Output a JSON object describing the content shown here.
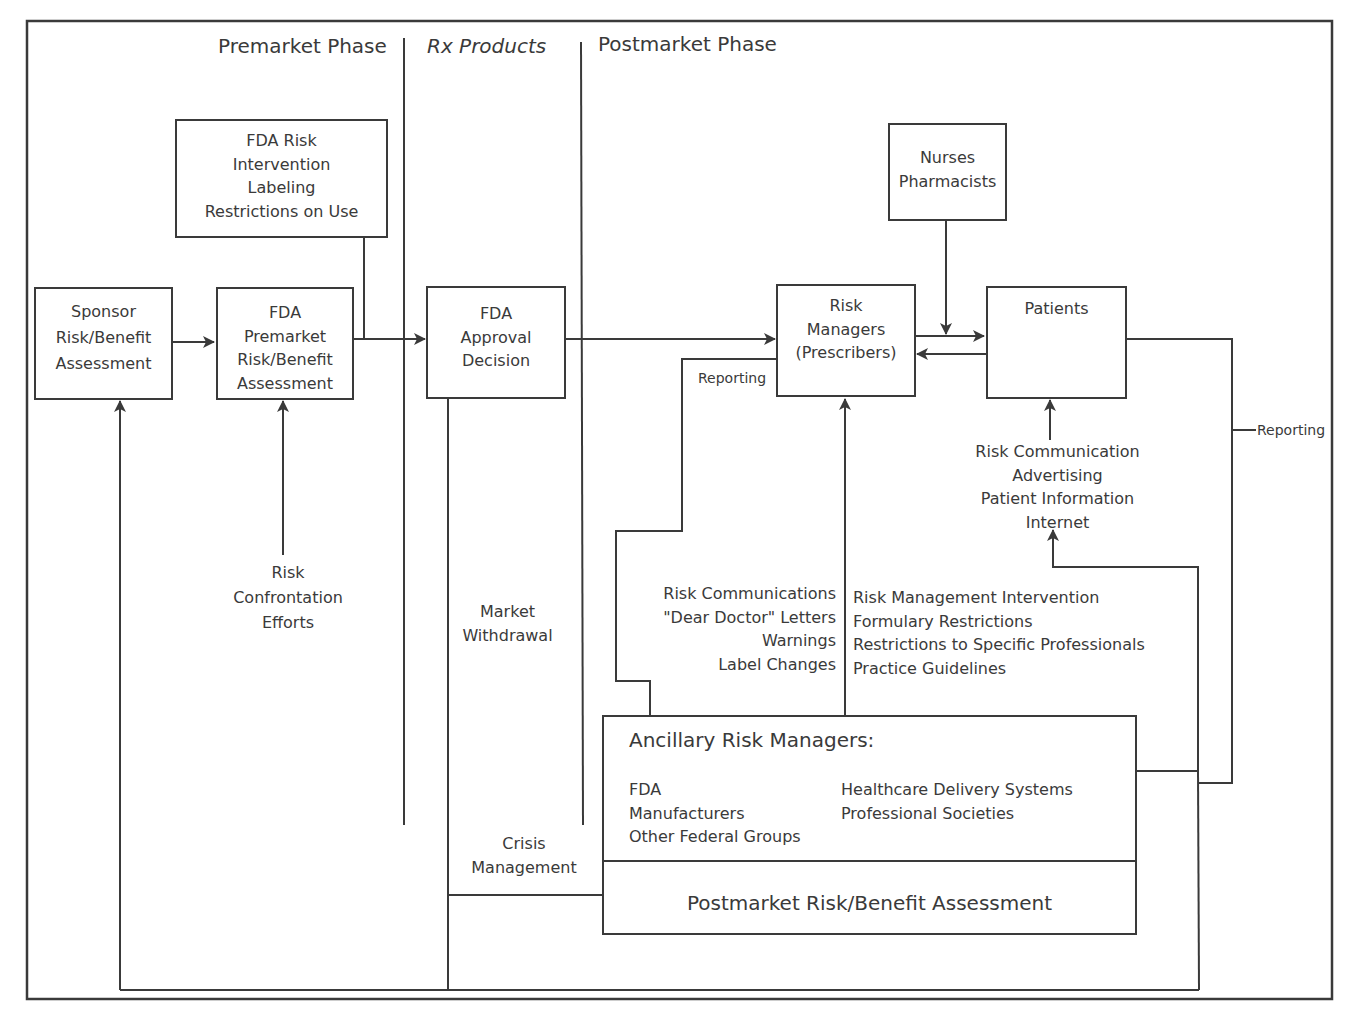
{
  "phases": {
    "premarket": "Premarket Phase",
    "rx_products": "Rx Products",
    "postmarket": "Postmarket Phase"
  },
  "boxes": {
    "fda_risk_intervention": [
      "FDA Risk",
      "Intervention",
      "Labeling",
      "Restrictions on Use"
    ],
    "sponsor_assessment": [
      "Sponsor",
      "Risk/Benefit",
      "Assessment"
    ],
    "fda_premarket_assessment": [
      "FDA",
      "Premarket",
      "Risk/Benefit",
      "Assessment"
    ],
    "fda_approval_decision": [
      "FDA",
      "Approval",
      "Decision"
    ],
    "risk_managers": [
      "Risk",
      "Managers",
      "(Prescribers)"
    ],
    "nurses_pharmacists": [
      "Nurses",
      "Pharmacists"
    ],
    "patients": [
      "Patients"
    ],
    "ancillary": {
      "title": "Ancillary Risk Managers:",
      "col1": [
        "FDA",
        "Manufacturers",
        "Other Federal Groups"
      ],
      "col2": [
        "Healthcare Delivery Systems",
        "Professional Societies"
      ]
    },
    "postmarket_assessment": "Postmarket Risk/Benefit Assessment"
  },
  "labels": {
    "risk_confrontation": [
      "Risk",
      "Confrontation",
      "Efforts"
    ],
    "market_withdrawal": [
      "Market",
      "Withdrawal"
    ],
    "crisis_management": [
      "Crisis",
      "Management"
    ],
    "reporting_left": "Reporting",
    "reporting_right": "Reporting",
    "risk_communications": [
      "Risk Communications",
      "\"Dear Doctor\" Letters",
      "Warnings",
      "Label Changes"
    ],
    "risk_management_intervention": [
      "Risk Management Intervention",
      "Formulary Restrictions",
      "Restrictions to Specific Professionals",
      "Practice Guidelines"
    ],
    "patient_communication": [
      "Risk Communication",
      "Advertising",
      "Patient Information",
      "Internet"
    ]
  },
  "colors": {
    "line": "#3a3a3a",
    "background": "#ffffff"
  }
}
